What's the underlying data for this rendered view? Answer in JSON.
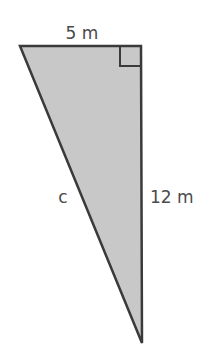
{
  "diagram": {
    "type": "right-triangle",
    "labels": {
      "top_side": "5 m",
      "hypotenuse": "c",
      "right_side": "12 m"
    },
    "colors": {
      "fill": "#c8c8c8",
      "stroke": "#3a3a3a",
      "text": "#4a4a4a"
    },
    "right_angle_marker": true
  }
}
